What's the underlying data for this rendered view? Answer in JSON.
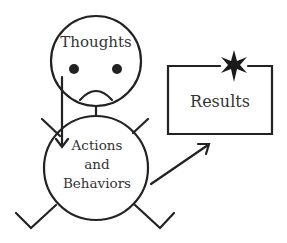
{
  "diagram": {
    "head": {
      "label": "Thoughts",
      "expression": "sad-face"
    },
    "body": {
      "label_lines": [
        "Actions",
        "and",
        "Behaviors"
      ]
    },
    "result_box": {
      "label": "Results",
      "decoration": "star-icon"
    },
    "arrows": [
      {
        "from": "Thoughts",
        "to": "Actions and Behaviors"
      },
      {
        "from": "Actions and Behaviors",
        "to": "Results"
      }
    ],
    "colors": {
      "stroke": "#222222",
      "text": "#333333",
      "background": "#ffffff"
    }
  }
}
